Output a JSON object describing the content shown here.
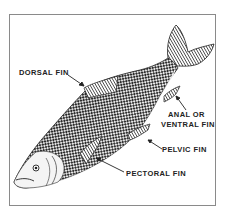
{
  "diagram": {
    "labels": {
      "dorsal": "DORSAL FIN",
      "anal_line1": "ANAL OR",
      "anal_line2": "VENTRAL FIN",
      "pelvic": "PELVIC FIN",
      "pectoral": "PECTORAL FIN"
    },
    "colors": {
      "ink": "#222222",
      "frame": "#8a8a8a",
      "background": "#ffffff"
    }
  }
}
